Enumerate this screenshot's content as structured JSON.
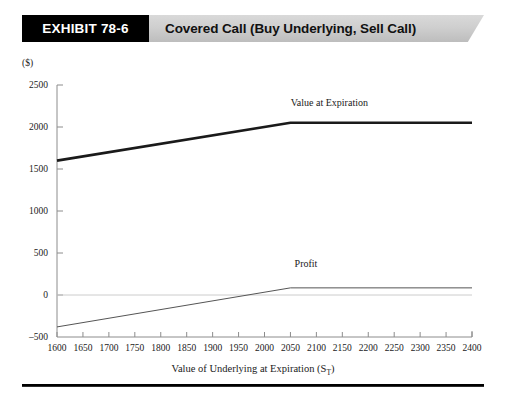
{
  "header": {
    "exhibit_tag": "EXHIBIT 78-6",
    "title": "Covered Call (Buy Underlying, Sell Call)"
  },
  "chart_data": {
    "type": "line",
    "title": "Covered Call (Buy Underlying, Sell Call)",
    "xlabel_main": "Value of Underlying at Expiration (S",
    "xlabel_sub": "T",
    "xlabel_close": ")",
    "ylabel": "($)",
    "unit_label": "($)",
    "xlim": [
      1600,
      2400
    ],
    "ylim": [
      -500,
      2500
    ],
    "grid": false,
    "legend_position": "inline-annotations",
    "x_ticks": [
      1600,
      1650,
      1700,
      1750,
      1800,
      1850,
      1900,
      1950,
      2000,
      2050,
      2100,
      2150,
      2200,
      2250,
      2300,
      2350,
      2400
    ],
    "y_ticks": [
      -500,
      0,
      500,
      1000,
      1500,
      2000,
      2500
    ],
    "x": [
      1600,
      2050,
      2400
    ],
    "series": [
      {
        "name": "Value at Expiration",
        "label": "Value  at Expiration",
        "color": "#1a1a1a",
        "values": [
          1600,
          2050,
          2050
        ],
        "label_x": 2125,
        "label_y": 2255
      },
      {
        "name": "Profit",
        "label": "Profit",
        "color": "#555555",
        "values": [
          -380,
          85,
          85
        ],
        "label_x": 2080,
        "label_y": 330
      }
    ],
    "zero_reference_line": 0,
    "annotations": [
      {
        "text": "Value  at Expiration",
        "x": 2125,
        "y": 2255
      },
      {
        "text": "Profit",
        "x": 2080,
        "y": 330
      }
    ]
  }
}
